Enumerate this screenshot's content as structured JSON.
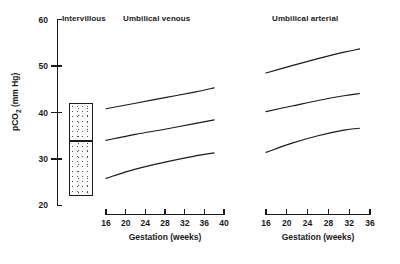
{
  "figure": {
    "yaxis": {
      "label_text": "pCO",
      "label_sub": "2",
      "label_unit": " (mm Hg)",
      "ticks": [
        60,
        50,
        40,
        30,
        20
      ],
      "range": [
        20,
        60
      ]
    },
    "panels": [
      {
        "key": "intervillous",
        "title": "Intervillous",
        "has_xaxis": false
      },
      {
        "key": "umbilical_venous",
        "title": "Umbilical venous",
        "has_xaxis": true,
        "xaxis": {
          "title": "Gestation (weeks)",
          "ticks": [
            16,
            20,
            24,
            28,
            32,
            36,
            40
          ],
          "range": [
            16,
            40
          ]
        }
      },
      {
        "key": "umbilical_arterial",
        "title": "Umbilical arterial",
        "has_xaxis": true,
        "xaxis": {
          "title": "Gestation (weeks)",
          "ticks": [
            16,
            20,
            24,
            28,
            32,
            36
          ],
          "range": [
            16,
            36
          ]
        }
      }
    ],
    "colors": {
      "ink": "#1a1a1a",
      "background": "#ffffff",
      "stipple": "#555555"
    }
  },
  "chart_data": {
    "type": "line",
    "title": "",
    "xlabel": "Gestation (weeks)",
    "ylabel": "pCO2 (mm Hg)",
    "ylim": [
      20,
      60
    ],
    "grid": false,
    "legend": "none",
    "panels": [
      {
        "name": "Intervillous",
        "type": "box",
        "box": {
          "upper": 42,
          "median": 34,
          "lower": 22,
          "fill": "stippled"
        }
      },
      {
        "name": "Umbilical venous",
        "type": "line",
        "xlim": [
          16,
          40
        ],
        "x": [
          16,
          22,
          28,
          34,
          38
        ],
        "series": [
          {
            "name": "upper centile",
            "values": [
              40.8,
              42.0,
              43.2,
              44.4,
              45.3
            ]
          },
          {
            "name": "median",
            "values": [
              34.0,
              35.3,
              36.4,
              37.6,
              38.4
            ]
          },
          {
            "name": "lower centile",
            "values": [
              25.8,
              27.8,
              29.3,
              30.6,
              31.3
            ]
          }
        ]
      },
      {
        "name": "Umbilical arterial",
        "type": "line",
        "xlim": [
          16,
          36
        ],
        "x": [
          16,
          21,
          26,
          31,
          34
        ],
        "series": [
          {
            "name": "upper centile",
            "values": [
              48.5,
              50.1,
              51.6,
              53.0,
              53.7
            ]
          },
          {
            "name": "median",
            "values": [
              40.2,
              41.4,
              42.6,
              43.6,
              44.1
            ]
          },
          {
            "name": "lower centile",
            "values": [
              31.4,
              33.4,
              35.0,
              36.2,
              36.6
            ]
          }
        ]
      }
    ]
  }
}
